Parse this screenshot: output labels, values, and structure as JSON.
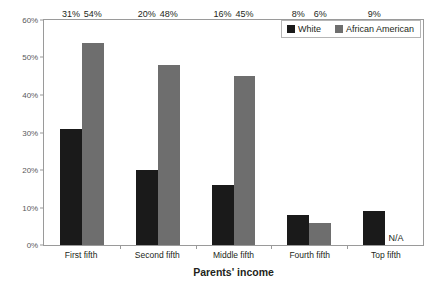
{
  "chart_data": {
    "type": "bar",
    "title": "",
    "xlabel": "Parents' income",
    "ylabel": "",
    "categories": [
      "First fifth",
      "Second fifth",
      "Middle fifth",
      "Fourth fifth",
      "Top fifth"
    ],
    "series": [
      {
        "name": "White",
        "color": "#1a1a1a",
        "values": [
          31,
          20,
          16,
          8,
          9
        ],
        "labels": [
          "31%",
          "20%",
          "16%",
          "8%",
          "9%"
        ]
      },
      {
        "name": "African American",
        "color": "#6e6e6e",
        "values": [
          54,
          48,
          45,
          6,
          null
        ],
        "labels": [
          "54%",
          "48%",
          "45%",
          "6%",
          "N/A"
        ]
      }
    ],
    "ylim": [
      0,
      60
    ],
    "yticks": [
      0,
      10,
      20,
      30,
      40,
      50,
      60
    ],
    "ytick_labels": [
      "0%",
      "10%",
      "20%",
      "30%",
      "40%",
      "50%",
      "60%"
    ],
    "grid": false,
    "legend_position": "top-right"
  },
  "legend": {
    "items": [
      {
        "label": "White",
        "swatch": "black-square-icon"
      },
      {
        "label": "African American",
        "swatch": "gray-square-icon"
      }
    ]
  }
}
